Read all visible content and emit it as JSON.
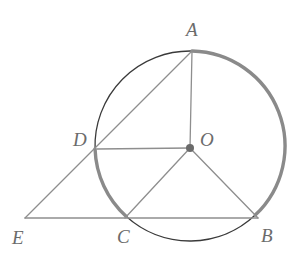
{
  "figure": {
    "background_color": "#ffffff",
    "width": 300,
    "height": 259
  },
  "style": {
    "thin_stroke_color": "#3a3a3a",
    "thin_stroke_width": 1.3,
    "thick_arc_color": "#8a8a8a",
    "thick_arc_width": 3.4,
    "segment_color": "#8e8e8e",
    "segment_width": 1.3,
    "center_dot_color": "#6a6a6a",
    "center_dot_radius": 4,
    "label_color": "#6b6b6b",
    "label_font_size": "19px"
  },
  "circle": {
    "center_x": 190,
    "center_y": 146,
    "radius": 95
  },
  "points": [
    {
      "id": "A",
      "label": "A",
      "x": 192,
      "y": 51,
      "label_x": 186,
      "label_y": 20
    },
    {
      "id": "B",
      "label": "B",
      "x": 258,
      "y": 218,
      "label_x": 261,
      "label_y": 226
    },
    {
      "id": "C",
      "label": "C",
      "x": 125,
      "y": 218,
      "label_x": 117,
      "label_y": 227
    },
    {
      "id": "D",
      "label": "D",
      "x": 97,
      "y": 149,
      "label_x": 73,
      "label_y": 130
    },
    {
      "id": "O",
      "label": "O",
      "x": 190,
      "y": 148,
      "label_x": 200,
      "label_y": 130
    },
    {
      "id": "E",
      "label": "E",
      "x": 25,
      "y": 218,
      "label_x": 12,
      "label_y": 228
    }
  ],
  "segments": [
    {
      "name": "segment-A-O",
      "from": "A",
      "to": "O"
    },
    {
      "name": "segment-D-O",
      "from": "D",
      "to": "O"
    },
    {
      "name": "segment-O-C",
      "from": "O",
      "to": "C"
    },
    {
      "name": "segment-O-B",
      "from": "O",
      "to": "B"
    },
    {
      "name": "segment-E-A",
      "from": "E",
      "to": "A",
      "through": "D"
    },
    {
      "name": "segment-E-B",
      "from": "E",
      "to": "B",
      "through": "C"
    }
  ],
  "arcs": [
    {
      "name": "arc-A-to-D",
      "from": "A",
      "to": "D",
      "weight": "thin",
      "direction": "counterclockwise"
    },
    {
      "name": "arc-D-to-C",
      "from": "D",
      "to": "C",
      "weight": "thick",
      "direction": "counterclockwise"
    },
    {
      "name": "arc-C-to-B",
      "from": "C",
      "to": "B",
      "weight": "thin",
      "direction": "counterclockwise"
    },
    {
      "name": "arc-B-to-A",
      "from": "B",
      "to": "A",
      "weight": "thick",
      "direction": "counterclockwise"
    }
  ]
}
